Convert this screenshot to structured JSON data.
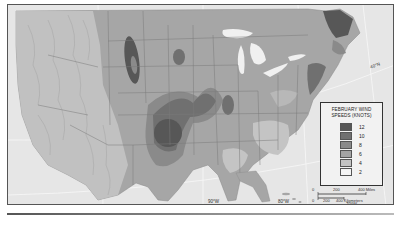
{
  "map": {
    "subject": "February wind speeds across the contiguous United States",
    "colors": {
      "ocean": "#e6e6e6",
      "land_base": "#a6a6a6",
      "mountains": "#c2c2c2",
      "great_lakes": "#efefef",
      "state_lines": "#777777",
      "border": "#555555"
    }
  },
  "legend": {
    "title_line1": "FEBRUARY WIND",
    "title_line2": "SPEEDS (KNOTS)",
    "items": [
      {
        "label": "12",
        "color": "#575757"
      },
      {
        "label": "10",
        "color": "#707070"
      },
      {
        "label": "8",
        "color": "#8a8a8a"
      },
      {
        "label": "6",
        "color": "#a4a4a4"
      },
      {
        "label": "4",
        "color": "#c4c4c4"
      },
      {
        "label": "2",
        "color": "#f4f4f4"
      }
    ]
  },
  "graticule": {
    "lat_labels": [
      {
        "label": "40°N"
      },
      {
        "label": "30°N"
      }
    ],
    "lon_labels": [
      {
        "label": "90°W"
      },
      {
        "label": "80°W"
      },
      {
        "label": "70°W"
      }
    ]
  },
  "scale_bar": {
    "miles": {
      "zero": "0",
      "mid": "200",
      "end": "400 Miles"
    },
    "km": {
      "zero": "0",
      "mid": "200",
      "end": "400 Kilometers"
    }
  }
}
